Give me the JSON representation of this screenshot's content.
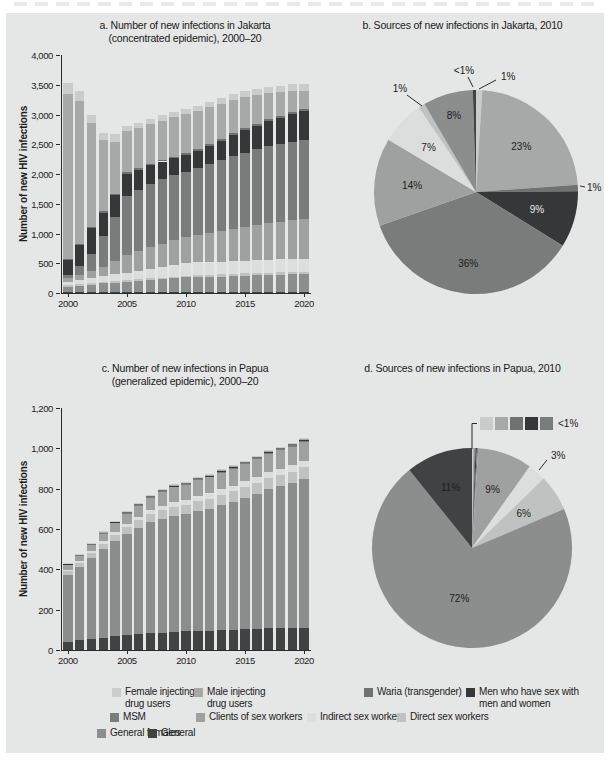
{
  "page": {
    "panel_bg": "#e5e6e6"
  },
  "titles": {
    "a_line1": "a. Number of new infections in Jakarta",
    "a_line2": "(concentrated epidemic), 2000–20",
    "b": "b. Sources of new infections in Jakarta, 2010",
    "c_line1": "c. Number of new infections in Papua",
    "c_line2": "(generalized epidemic), 2000–20",
    "d": "d. Sources of new infections in Papua, 2010"
  },
  "categories": [
    {
      "id": "female_idu",
      "label": "Female injecting drug users",
      "color": "#c9cccb"
    },
    {
      "id": "male_idu",
      "label": "Male injecting drug users",
      "color": "#a6a9a8"
    },
    {
      "id": "waria",
      "label": "Waria (transgender)",
      "color": "#6e7271"
    },
    {
      "id": "msmw",
      "label": "Men who have sex with men and women",
      "color": "#343838"
    },
    {
      "id": "msm",
      "label": "MSM",
      "color": "#787c7b"
    },
    {
      "id": "clients",
      "label": "Clients of sex workers",
      "color": "#9ea1a0"
    },
    {
      "id": "indirect",
      "label": "Indirect sex workers",
      "color": "#dcdedd"
    },
    {
      "id": "direct",
      "label": "Direct sex workers",
      "color": "#bfc2c1"
    },
    {
      "id": "general_females",
      "label": "General females",
      "color": "#8b8e8d"
    },
    {
      "id": "general",
      "label": "General",
      "color": "#3f4343"
    }
  ],
  "chart_data": [
    {
      "id": "a",
      "type": "bar",
      "stacked": true,
      "title": "a. Number of new infections in Jakarta (concentrated epidemic), 2000–20",
      "xlabel": "",
      "ylabel": "Number of new HIV infections",
      "ylim": [
        0,
        4000
      ],
      "yticks": [
        "4,000",
        "3,500",
        "3,000",
        "2,500",
        "2,000",
        "1,500",
        "1,000",
        "500",
        "0"
      ],
      "xticks": [
        2000,
        2005,
        2010,
        2015,
        2020
      ],
      "years": [
        2000,
        2001,
        2002,
        2003,
        2004,
        2005,
        2006,
        2007,
        2008,
        2009,
        2010,
        2011,
        2012,
        2013,
        2014,
        2015,
        2016,
        2017,
        2018,
        2019,
        2020
      ],
      "series": [
        {
          "cat": "general",
          "name": "General",
          "values": [
            10,
            10,
            12,
            12,
            12,
            14,
            14,
            15,
            15,
            15,
            16,
            16,
            17,
            17,
            18,
            18,
            19,
            19,
            20,
            20,
            20
          ]
        },
        {
          "cat": "general_females",
          "name": "General females",
          "values": [
            90,
            110,
            130,
            150,
            160,
            170,
            185,
            200,
            215,
            230,
            245,
            250,
            255,
            260,
            270,
            275,
            280,
            285,
            290,
            295,
            300
          ]
        },
        {
          "cat": "direct",
          "name": "Direct sex workers",
          "values": [
            30,
            30,
            30,
            30,
            30,
            30,
            30,
            30,
            30,
            30,
            30,
            32,
            34,
            35,
            36,
            38,
            38,
            39,
            40,
            40,
            40
          ]
        },
        {
          "cat": "indirect",
          "name": "Indirect sex workers",
          "values": [
            50,
            70,
            80,
            100,
            110,
            120,
            140,
            160,
            180,
            200,
            215,
            215,
            215,
            215,
            215,
            215,
            215,
            215,
            215,
            215,
            215
          ]
        },
        {
          "cat": "clients",
          "name": "Clients of sex workers",
          "values": [
            70,
            90,
            110,
            150,
            220,
            300,
            330,
            360,
            390,
            410,
            430,
            455,
            480,
            510,
            540,
            565,
            590,
            615,
            635,
            655,
            670
          ]
        },
        {
          "cat": "msm",
          "name": "MSM",
          "values": [
            50,
            150,
            300,
            520,
            740,
            1000,
            1030,
            1060,
            1080,
            1090,
            1105,
            1130,
            1160,
            1190,
            1220,
            1250,
            1270,
            1290,
            1300,
            1320,
            1330
          ]
        },
        {
          "cat": "msmw",
          "name": "Men who have sex with men and women",
          "values": [
            250,
            350,
            430,
            390,
            370,
            370,
            340,
            320,
            300,
            290,
            280,
            295,
            310,
            330,
            355,
            380,
            400,
            425,
            445,
            470,
            490
          ]
        },
        {
          "cat": "waria",
          "name": "Waria (transgender)",
          "values": [
            20,
            20,
            20,
            22,
            22,
            25,
            25,
            25,
            28,
            28,
            30,
            30,
            30,
            32,
            32,
            33,
            33,
            34,
            34,
            35,
            35
          ]
        },
        {
          "cat": "male_idu",
          "name": "Male injecting drug users",
          "values": [
            2780,
            2400,
            1740,
            1190,
            880,
            690,
            680,
            670,
            660,
            660,
            650,
            640,
            620,
            590,
            560,
            520,
            480,
            440,
            400,
            350,
            300
          ]
        },
        {
          "cat": "female_idu",
          "name": "Female injecting drug users",
          "values": [
            180,
            160,
            140,
            130,
            120,
            95,
            90,
            88,
            86,
            85,
            85,
            88,
            90,
            92,
            95,
            98,
            100,
            103,
            106,
            110,
            115
          ]
        }
      ]
    },
    {
      "id": "b",
      "type": "pie",
      "title": "b. Sources of new infections in Jakarta, 2010",
      "slices": [
        {
          "cat": "female_idu",
          "label": "1%",
          "value": 1
        },
        {
          "cat": "male_idu",
          "label": "23%",
          "value": 23
        },
        {
          "cat": "waria",
          "label": "1%",
          "value": 1
        },
        {
          "cat": "msmw",
          "label": "9%",
          "value": 9
        },
        {
          "cat": "msm",
          "label": "36%",
          "value": 36
        },
        {
          "cat": "clients",
          "label": "14%",
          "value": 14
        },
        {
          "cat": "indirect",
          "label": "7%",
          "value": 7
        },
        {
          "cat": "direct",
          "label": "1%",
          "value": 1
        },
        {
          "cat": "general_females",
          "label": "8%",
          "value": 8
        },
        {
          "cat": "general",
          "label": "<1%",
          "value": 0.5
        }
      ]
    },
    {
      "id": "c",
      "type": "bar",
      "stacked": true,
      "title": "c. Number of new infections in Papua (generalized epidemic), 2000–20",
      "xlabel": "",
      "ylabel": "Number of new HIV infections",
      "ylim": [
        0,
        1200
      ],
      "yticks": [
        "1,200",
        "1,000",
        "800",
        "600",
        "400",
        "200",
        "0"
      ],
      "xticks": [
        2000,
        2005,
        2010,
        2015,
        2020
      ],
      "years": [
        2000,
        2001,
        2002,
        2003,
        2004,
        2005,
        2006,
        2007,
        2008,
        2009,
        2010,
        2011,
        2012,
        2013,
        2014,
        2015,
        2016,
        2017,
        2018,
        2019,
        2020
      ],
      "series": [
        {
          "cat": "general",
          "name": "General",
          "values": [
            40,
            50,
            55,
            60,
            70,
            75,
            80,
            85,
            85,
            90,
            92,
            95,
            95,
            100,
            100,
            105,
            105,
            110,
            110,
            110,
            110
          ]
        },
        {
          "cat": "general_females",
          "name": "General females",
          "values": [
            330,
            360,
            400,
            440,
            470,
            500,
            525,
            548,
            565,
            575,
            580,
            595,
            605,
            620,
            635,
            650,
            670,
            690,
            705,
            720,
            740
          ]
        },
        {
          "cat": "direct",
          "name": "Direct sex workers",
          "values": [
            20,
            22,
            25,
            28,
            32,
            35,
            38,
            40,
            43,
            46,
            48,
            49,
            50,
            51,
            52,
            53,
            53,
            54,
            54,
            55,
            55
          ]
        },
        {
          "cat": "indirect",
          "name": "Indirect sex workers",
          "values": [
            8,
            9,
            10,
            12,
            14,
            16,
            18,
            20,
            22,
            24,
            25,
            26,
            26,
            27,
            28,
            28,
            29,
            29,
            30,
            30,
            30
          ]
        },
        {
          "cat": "clients",
          "name": "Clients of sex workers",
          "values": [
            25,
            28,
            32,
            38,
            44,
            50,
            56,
            62,
            68,
            72,
            75,
            78,
            80,
            82,
            84,
            86,
            88,
            90,
            92,
            94,
            96
          ]
        },
        {
          "cat": "msm",
          "name": "MSM",
          "values": [
            3,
            3,
            3,
            4,
            4,
            4,
            4,
            5,
            5,
            5,
            5,
            5,
            5,
            6,
            6,
            6,
            6,
            6,
            6,
            7,
            7
          ]
        },
        {
          "cat": "msmw",
          "name": "Men who have sex with men and women",
          "values": [
            2,
            2,
            2,
            2,
            3,
            3,
            3,
            3,
            3,
            3,
            3,
            3,
            3,
            4,
            4,
            4,
            4,
            4,
            4,
            4,
            4
          ]
        },
        {
          "cat": "waria",
          "name": "Waria (transgender)",
          "values": [
            1,
            1,
            1,
            1,
            1,
            1,
            2,
            2,
            2,
            2,
            2,
            2,
            2,
            2,
            2,
            2,
            2,
            2,
            2,
            2,
            2
          ]
        },
        {
          "cat": "male_idu",
          "name": "Male injecting drug users",
          "values": [
            2,
            2,
            2,
            2,
            3,
            3,
            3,
            3,
            3,
            3,
            3,
            3,
            3,
            3,
            3,
            3,
            3,
            3,
            3,
            3,
            3
          ]
        },
        {
          "cat": "female_idu",
          "name": "Female injecting drug users",
          "values": [
            1,
            1,
            1,
            1,
            1,
            1,
            2,
            2,
            2,
            2,
            2,
            2,
            2,
            2,
            2,
            2,
            2,
            2,
            2,
            2,
            2
          ]
        }
      ]
    },
    {
      "id": "d",
      "type": "pie",
      "title": "d. Sources of new infections in Papua, 2010",
      "callout_label": "<1%",
      "callout_cats": [
        "female_idu",
        "male_idu",
        "waria",
        "msmw",
        "msm"
      ],
      "slices": [
        {
          "cat": "female_idu",
          "label": "",
          "value": 0.2
        },
        {
          "cat": "male_idu",
          "label": "",
          "value": 0.2
        },
        {
          "cat": "waria",
          "label": "",
          "value": 0.2
        },
        {
          "cat": "msmw",
          "label": "",
          "value": 0.2
        },
        {
          "cat": "msm",
          "label": "",
          "value": 0.2
        },
        {
          "cat": "clients",
          "label": "9%",
          "value": 9
        },
        {
          "cat": "indirect",
          "label": "3%",
          "value": 3
        },
        {
          "cat": "direct",
          "label": "6%",
          "value": 6
        },
        {
          "cat": "general_females",
          "label": "72%",
          "value": 72
        },
        {
          "cat": "general",
          "label": "11%",
          "value": 11
        }
      ]
    }
  ],
  "legend": {
    "rows": [
      [
        {
          "cat": "female_idu",
          "label": "Female injecting\ndrug users"
        },
        {
          "cat": "male_idu",
          "label": "Male injecting\ndrug users"
        },
        {
          "cat": "waria",
          "label": "Waria (transgender)"
        },
        {
          "cat": "msmw",
          "label": "Men who have sex with\nmen and women"
        }
      ],
      [
        {
          "cat": "msm",
          "label": "MSM"
        },
        {
          "cat": "clients",
          "label": "Clients of sex workers"
        },
        {
          "cat": "indirect",
          "label": "Indirect sex workers"
        },
        {
          "cat": "direct",
          "label": "Direct sex workers"
        }
      ],
      [
        {
          "cat": "general_females",
          "label": "General females"
        },
        {
          "cat": "general",
          "label": "General"
        }
      ]
    ]
  }
}
